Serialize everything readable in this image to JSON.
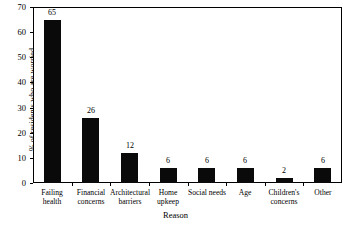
{
  "chart_data": {
    "type": "bar",
    "title": "",
    "xlabel": "Reason",
    "ylabel": "% of residents who are worried",
    "categories": [
      "Failing health",
      "Financial concerns",
      "Architectural barriers",
      "Home upkeep",
      "Social needs",
      "Age",
      "Children's concerns",
      "Other"
    ],
    "category_lines": [
      [
        "Failing",
        "health"
      ],
      [
        "Financial",
        "concerns"
      ],
      [
        "Architectural",
        "barriers"
      ],
      [
        "Home",
        "upkeep"
      ],
      [
        "Social needs",
        ""
      ],
      [
        "Age",
        ""
      ],
      [
        "Children's",
        "concerns"
      ],
      [
        "Other",
        ""
      ]
    ],
    "values": [
      65,
      26,
      12,
      6,
      6,
      6,
      2,
      6
    ],
    "value_labels": [
      "65",
      "26",
      "12",
      "6",
      "6",
      "6",
      "2",
      "6"
    ],
    "ylim": [
      0,
      70
    ],
    "yticks": [
      0,
      10,
      20,
      30,
      40,
      50,
      60,
      70
    ],
    "ytick_labels": [
      "0",
      "10",
      "20",
      "30",
      "40",
      "50",
      "60",
      "70"
    ],
    "grid": false,
    "legend": "none",
    "bar_color": "#0a0a0a",
    "background_color": "#ffffff",
    "axis_color": "#000000"
  }
}
